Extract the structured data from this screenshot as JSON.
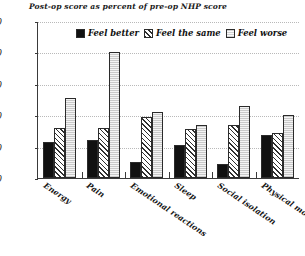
{
  "chart_data": {
    "type": "bar",
    "title": "Post-op score as percent of pre-op NHP score",
    "xlabel": "",
    "ylabel": "",
    "ylim": [
      0,
      250
    ],
    "yticks": [
      0,
      50,
      100,
      150,
      200,
      250
    ],
    "grid": true,
    "legend_position": "top-center-inside",
    "categories": [
      "Energy",
      "Pain",
      "Emotional reactions",
      "Sleep",
      "Social isolation",
      "Physical mobility"
    ],
    "series": [
      {
        "name": "Feel better",
        "values": [
          58,
          60,
          25,
          53,
          22,
          68
        ]
      },
      {
        "name": "Feel the same",
        "values": [
          80,
          80,
          97,
          78,
          85,
          72
        ]
      },
      {
        "name": "Feel worse",
        "values": [
          127,
          201,
          105,
          85,
          115,
          100
        ]
      }
    ]
  },
  "legend": {
    "items": [
      {
        "label": "Feel better"
      },
      {
        "label": "Feel the same"
      },
      {
        "label": "Feel worse"
      }
    ]
  },
  "axis": {
    "y_tick_labels": [
      "250",
      "200",
      "150",
      "100",
      "50",
      "0"
    ]
  }
}
